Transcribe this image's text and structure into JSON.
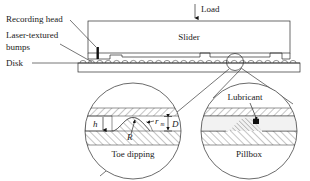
{
  "figure": {
    "background_color": "#ffffff",
    "line_color": "#2b2b2b",
    "text_color": "#1a1a1a"
  },
  "top_view": {
    "load_label": "Load",
    "slider_label": "Slider",
    "recording_head_label": "Recording head",
    "laser_textured_label_line1": "Laser-textured",
    "laser_textured_label_line2": "bumps",
    "disk_label": "Disk",
    "bump_count": 26
  },
  "detail_left": {
    "caption": "Toe dipping",
    "gap_label": "h",
    "meniscus_label": "r",
    "meniscus_subscript": "m",
    "bump_height_label": "D",
    "bump_radius_label": "R"
  },
  "detail_right": {
    "caption": "Pillbox",
    "lubricant_label": "Lubricant"
  }
}
